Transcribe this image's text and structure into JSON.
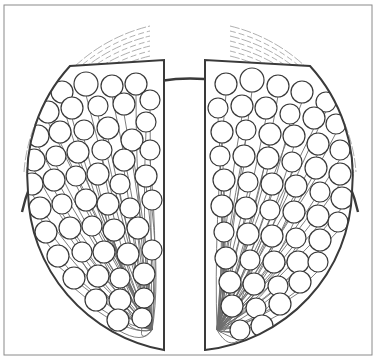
{
  "canvas": {
    "width": 377,
    "height": 359,
    "background": "#ffffff"
  },
  "colors": {
    "ink": "#3a3a3a",
    "ink_light": "#6e6e6e",
    "hatch": "#9a9a9a",
    "fill": "#ffffff",
    "frame": "#8a8a8a"
  },
  "frame": {
    "x": 4,
    "y": 5,
    "width": 368,
    "height": 350
  },
  "outer_shell": {
    "cx": 190,
    "cy": 182,
    "rx": 172,
    "ry": 170,
    "top_y": 13
  },
  "central_slot": {
    "left_x": 164,
    "right_x": 205,
    "top_y": 60,
    "bottom_y": 350
  },
  "lobes": [
    {
      "name": "left",
      "inner_x": 164,
      "top_y": 60,
      "bottom_y": 348
    },
    {
      "name": "right",
      "inner_x": 205,
      "top_y": 60,
      "bottom_y": 350
    }
  ],
  "hatching": {
    "count": 7
  },
  "clusters": {
    "radius_range": [
      9,
      12
    ],
    "left": [
      [
        62,
        92,
        11
      ],
      [
        86,
        84,
        12
      ],
      [
        112,
        86,
        11
      ],
      [
        136,
        84,
        11
      ],
      [
        150,
        100,
        10
      ],
      [
        48,
        112,
        11
      ],
      [
        72,
        108,
        11
      ],
      [
        98,
        106,
        10
      ],
      [
        124,
        104,
        11
      ],
      [
        146,
        122,
        10
      ],
      [
        38,
        136,
        11
      ],
      [
        60,
        132,
        11
      ],
      [
        84,
        130,
        10
      ],
      [
        108,
        128,
        11
      ],
      [
        132,
        140,
        11
      ],
      [
        34,
        160,
        11
      ],
      [
        56,
        156,
        10
      ],
      [
        78,
        152,
        11
      ],
      [
        102,
        150,
        10
      ],
      [
        124,
        160,
        11
      ],
      [
        150,
        150,
        10
      ],
      [
        32,
        184,
        11
      ],
      [
        54,
        180,
        11
      ],
      [
        76,
        176,
        10
      ],
      [
        98,
        174,
        11
      ],
      [
        120,
        184,
        10
      ],
      [
        146,
        176,
        11
      ],
      [
        40,
        208,
        11
      ],
      [
        62,
        204,
        10
      ],
      [
        86,
        200,
        11
      ],
      [
        108,
        204,
        11
      ],
      [
        130,
        208,
        10
      ],
      [
        152,
        200,
        10
      ],
      [
        46,
        232,
        11
      ],
      [
        70,
        228,
        11
      ],
      [
        92,
        226,
        10
      ],
      [
        114,
        230,
        11
      ],
      [
        138,
        228,
        11
      ],
      [
        58,
        256,
        11
      ],
      [
        82,
        252,
        10
      ],
      [
        104,
        252,
        11
      ],
      [
        128,
        254,
        11
      ],
      [
        152,
        250,
        10
      ],
      [
        74,
        278,
        11
      ],
      [
        98,
        276,
        11
      ],
      [
        120,
        278,
        10
      ],
      [
        144,
        274,
        11
      ],
      [
        96,
        300,
        11
      ],
      [
        120,
        300,
        11
      ],
      [
        144,
        298,
        10
      ],
      [
        118,
        320,
        11
      ],
      [
        142,
        318,
        10
      ]
    ],
    "right": [
      [
        226,
        84,
        11
      ],
      [
        252,
        80,
        12
      ],
      [
        278,
        86,
        11
      ],
      [
        302,
        92,
        11
      ],
      [
        326,
        102,
        10
      ],
      [
        218,
        108,
        10
      ],
      [
        242,
        106,
        11
      ],
      [
        266,
        108,
        11
      ],
      [
        290,
        114,
        10
      ],
      [
        314,
        118,
        11
      ],
      [
        336,
        124,
        10
      ],
      [
        222,
        132,
        11
      ],
      [
        246,
        130,
        10
      ],
      [
        270,
        134,
        11
      ],
      [
        294,
        136,
        11
      ],
      [
        318,
        144,
        11
      ],
      [
        340,
        150,
        10
      ],
      [
        220,
        156,
        10
      ],
      [
        244,
        156,
        11
      ],
      [
        268,
        158,
        11
      ],
      [
        292,
        162,
        10
      ],
      [
        316,
        168,
        11
      ],
      [
        340,
        174,
        11
      ],
      [
        224,
        180,
        11
      ],
      [
        248,
        182,
        10
      ],
      [
        272,
        184,
        11
      ],
      [
        296,
        186,
        11
      ],
      [
        320,
        192,
        10
      ],
      [
        342,
        198,
        11
      ],
      [
        222,
        206,
        11
      ],
      [
        246,
        208,
        11
      ],
      [
        270,
        210,
        10
      ],
      [
        294,
        212,
        11
      ],
      [
        318,
        216,
        11
      ],
      [
        338,
        222,
        10
      ],
      [
        224,
        232,
        10
      ],
      [
        248,
        234,
        11
      ],
      [
        272,
        236,
        11
      ],
      [
        296,
        238,
        10
      ],
      [
        320,
        240,
        11
      ],
      [
        226,
        258,
        11
      ],
      [
        250,
        260,
        10
      ],
      [
        274,
        262,
        11
      ],
      [
        298,
        262,
        11
      ],
      [
        318,
        262,
        10
      ],
      [
        230,
        282,
        11
      ],
      [
        254,
        284,
        11
      ],
      [
        278,
        286,
        10
      ],
      [
        300,
        282,
        11
      ],
      [
        232,
        306,
        11
      ],
      [
        256,
        308,
        10
      ],
      [
        280,
        304,
        11
      ],
      [
        240,
        330,
        10
      ],
      [
        262,
        326,
        11
      ]
    ]
  }
}
